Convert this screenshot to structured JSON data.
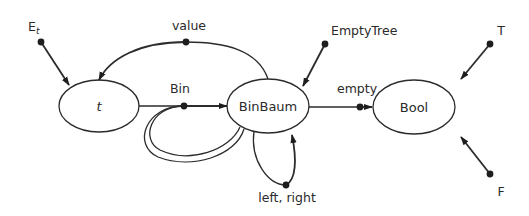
{
  "diagram": {
    "type": "signature-graph",
    "nodes": [
      {
        "id": "t",
        "label": "t",
        "italic": true
      },
      {
        "id": "binbaum",
        "label": "BinBaum"
      },
      {
        "id": "bool",
        "label": "Bool"
      }
    ],
    "operations": [
      {
        "id": "e_t",
        "label": "E",
        "subscript": "t",
        "from": [],
        "to": "t"
      },
      {
        "id": "value",
        "label": "value",
        "from": [
          "binbaum"
        ],
        "to": "t"
      },
      {
        "id": "bin",
        "label": "Bin",
        "from": [
          "t",
          "binbaum",
          "binbaum"
        ],
        "to": "binbaum"
      },
      {
        "id": "emptytree",
        "label": "EmptyTree",
        "from": [],
        "to": "binbaum"
      },
      {
        "id": "empty",
        "label": "empty",
        "from": [
          "binbaum"
        ],
        "to": "bool"
      },
      {
        "id": "left_right",
        "label": "left, right",
        "from": [
          "binbaum"
        ],
        "to": "binbaum"
      },
      {
        "id": "T",
        "label": "T",
        "from": [],
        "to": "bool"
      },
      {
        "id": "F",
        "label": "F",
        "from": [],
        "to": "bool"
      }
    ]
  }
}
